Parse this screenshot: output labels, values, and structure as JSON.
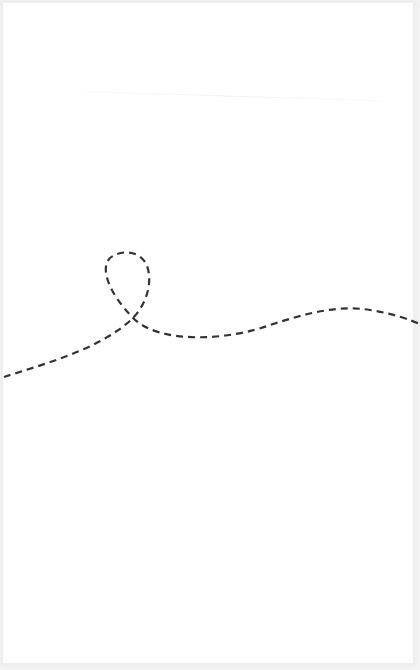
{
  "canvas": {
    "width": 420,
    "height": 670,
    "background": "#ffffff",
    "edge_tint": "#f4f4f4"
  },
  "drawing": {
    "stroke_color": "#333333",
    "stroke_width": 2.2,
    "dash_pattern": "7 5",
    "description": "Single dashed curved line with a loop",
    "path": "M 4 377 C 40 365, 100 350, 133 318 C 150 300, 153 275, 145 262 C 137 250, 120 250, 110 258 C 100 268, 108 292, 133 318 C 160 345, 230 340, 270 325 C 310 312, 340 305, 370 310 C 395 314, 410 320, 420 324"
  }
}
